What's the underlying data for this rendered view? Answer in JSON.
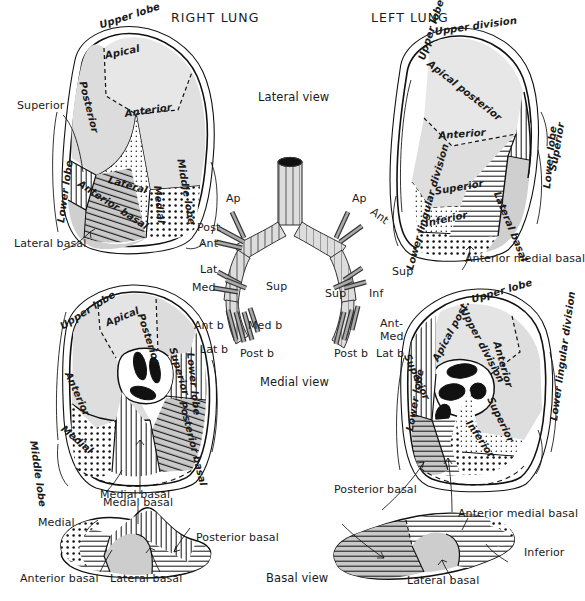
{
  "figure": {
    "headers": {
      "right_lung": "RIGHT LUNG",
      "left_lung": "LEFT LUNG"
    },
    "views": {
      "lateral": "Lateral view",
      "medial": "Medial view",
      "basal": "Basal view"
    }
  },
  "right_lateral": {
    "lobes": {
      "upper": "Upper lobe",
      "middle": "Middle lobe",
      "lower": "Lower lobe"
    },
    "segments": {
      "apical": "Apical",
      "posterior": "Posterior",
      "anterior": "Anterior",
      "lateral": "Lateral",
      "medial": "Medial",
      "superior": "Superior",
      "anterior_basal": "Anterior basal",
      "lateral_basal": "Lateral basal"
    }
  },
  "left_lateral": {
    "lobes": {
      "upper": "Upper lobe",
      "lower": "Lower lobe"
    },
    "divisions": {
      "upper": "Upper division",
      "lower_lingular": "Lower lingular division"
    },
    "segments": {
      "apical_posterior": "Apical posterior",
      "anterior": "Anterior",
      "superior": "Superior",
      "inferior": "Inferior",
      "lateral_basal": "Lateral basal",
      "superior_lower": "Superior",
      "anterior_medial_basal": "Anterior medial basal"
    }
  },
  "right_medial": {
    "lobes": {
      "upper": "Upper lobe",
      "middle": "Middle lobe",
      "lower": "Lower lobe"
    },
    "segments": {
      "apical": "Apical",
      "posterior": "Posterior",
      "anterior": "Anterior",
      "medial": "Medial",
      "superior": "Superior",
      "posterior_basal": "Posterior basal",
      "medial_basal": "Medial basal"
    }
  },
  "left_medial": {
    "lobes": {
      "upper": "Upper lobe",
      "lower": "Lower lobe"
    },
    "divisions": {
      "upper": "Upper division",
      "lower_lingular": "Lower lingular division"
    },
    "segments": {
      "apical_post": "Apical post.",
      "anterior": "Anterior",
      "superior_lingula": "Superior",
      "inferior_lingula": "Inferior",
      "superior_lower": "Superior",
      "posterior_basal": "Posterior basal",
      "anterior_medial_basal": "Anterior medial basal"
    }
  },
  "right_basal": {
    "segments": {
      "medial": "Medial",
      "medial_basal": "Medial basal",
      "anterior_basal": "Anterior basal",
      "lateral_basal": "Lateral basal",
      "posterior_basal": "Posterior basal"
    }
  },
  "left_basal": {
    "segments": {
      "posterior_basal": "Posterior basal",
      "lateral_basal": "Lateral basal",
      "inferior": "Inferior",
      "anterior_medial_basal": "Anterior medial basal"
    }
  },
  "bronchial_tree": {
    "right": {
      "upper_lobe": [
        "Ap",
        "Post",
        "Ant"
      ],
      "middle_lobe": [
        "Lat",
        "Med"
      ],
      "lower_lobe": [
        "Sup",
        "Ant b",
        "Med b",
        "Lat b",
        "Post b"
      ]
    },
    "left": {
      "upper_lobe": [
        "Ap",
        "Ant"
      ],
      "lingula": [
        "Sup",
        "Inf"
      ],
      "lower_lobe": [
        "Sup",
        "Ant-",
        "Med",
        "Post b",
        "Lat b"
      ]
    }
  },
  "colors": {
    "ink": "#111111",
    "light_fill": "#e3e3e3",
    "mid_fill": "#c9c9c9",
    "paper": "#ffffff"
  }
}
